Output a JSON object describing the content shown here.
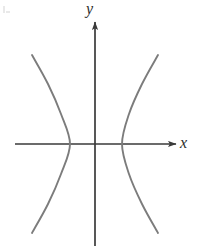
{
  "figure": {
    "name": "hyperbola-graph",
    "background_color": "#ffffff",
    "axis_color": "#3a3a3a",
    "curve_color": "#7c7c7c"
  },
  "axes": {
    "x_label": "x",
    "y_label": "y",
    "origin": {
      "x": 95,
      "y": 144
    },
    "x_axis": {
      "start_x": 15,
      "end_x": 176,
      "y": 144,
      "arrow": "right"
    },
    "y_axis": {
      "x": 95,
      "start_y": 246,
      "end_y": 22,
      "arrow": "up"
    }
  },
  "chart_data": {
    "type": "line",
    "title": "",
    "xlabel": "x",
    "ylabel": "y",
    "grid": false,
    "legend": null,
    "curve_name": "hyperbola",
    "equation": "x^2/a^2 - y^2/b^2 = 1",
    "orientation": "opens-left-and-right",
    "center": {
      "x": 0,
      "y": 0
    },
    "vertices_px": [
      {
        "x": 70,
        "y": 144
      },
      {
        "x": 122,
        "y": 144
      }
    ],
    "semi_axis_a_px": 26,
    "branches": [
      {
        "name": "left-branch",
        "points_px": [
          {
            "x": 32,
            "y": 55
          },
          {
            "x": 48,
            "y": 84
          },
          {
            "x": 61,
            "y": 114
          },
          {
            "x": 70,
            "y": 144
          },
          {
            "x": 61,
            "y": 174
          },
          {
            "x": 48,
            "y": 204
          },
          {
            "x": 32,
            "y": 233
          }
        ]
      },
      {
        "name": "right-branch",
        "points_px": [
          {
            "x": 158,
            "y": 55
          },
          {
            "x": 142,
            "y": 84
          },
          {
            "x": 129,
            "y": 114
          },
          {
            "x": 122,
            "y": 144
          },
          {
            "x": 129,
            "y": 174
          },
          {
            "x": 142,
            "y": 204
          },
          {
            "x": 158,
            "y": 233
          }
        ]
      }
    ],
    "xlim": [
      15,
      176
    ],
    "ylim": [
      22,
      246
    ]
  }
}
